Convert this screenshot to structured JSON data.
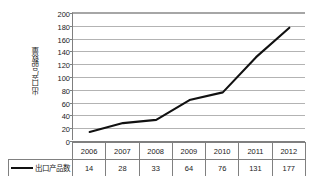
{
  "chart_data": {
    "type": "line",
    "title": "",
    "xlabel": "",
    "ylabel": "出口产品数量",
    "categories": [
      "2006",
      "2007",
      "2008",
      "2009",
      "2010",
      "2011",
      "2012"
    ],
    "series": [
      {
        "name": "出口产品数",
        "values": [
          14,
          28,
          33,
          64,
          76,
          131,
          177
        ]
      }
    ],
    "ylim": [
      0,
      200
    ],
    "ytick_step": 20,
    "yticks": [
      "200",
      "180",
      "160",
      "140",
      "120",
      "100",
      "80",
      "60",
      "40",
      "20",
      "0"
    ],
    "grid": true,
    "legend_position": "bottom-left-table",
    "colors": {
      "series_line": "#111111",
      "gridline": "#b3b3b3",
      "axis": "#7f7f7f",
      "table_border": "#808080",
      "text": "#1a1a1a",
      "background": "#ffffff"
    }
  },
  "legend": {
    "marker_name": "line-marker",
    "label": "出口产品数"
  }
}
